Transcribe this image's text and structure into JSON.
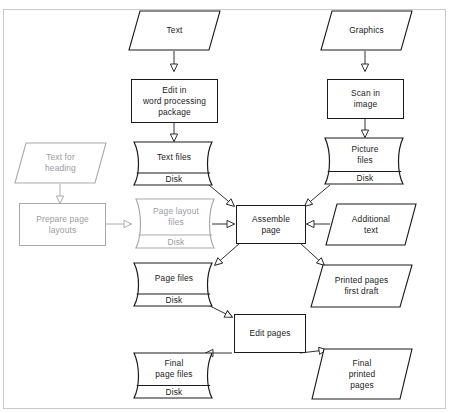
{
  "page": {
    "header_fragment": "",
    "diagram_title": "Desktop publishing workflow flowchart"
  },
  "colors": {
    "ink": "#1b1b1b",
    "dim_ink": "#9b9ba2",
    "frame": "#c9c9cf",
    "background": "#ffffff"
  },
  "nodes": {
    "text_input": {
      "label": "Text",
      "type": "input-output",
      "state": "normal"
    },
    "graphics_input": {
      "label": "Graphics",
      "type": "input-output",
      "state": "normal"
    },
    "edit_word": {
      "label": "Edit in\nword processing\npackage",
      "type": "process",
      "state": "normal"
    },
    "scan_image": {
      "label": "Scan in\nimage",
      "type": "process",
      "state": "normal"
    },
    "text_for_heading": {
      "label": "Text for\nheading",
      "type": "input-output",
      "state": "dim"
    },
    "text_files": {
      "label": "Text files",
      "type": "disk",
      "state": "normal",
      "media": "Disk"
    },
    "picture_files": {
      "label": "Picture\nfiles",
      "type": "disk",
      "state": "normal",
      "media": "Disk"
    },
    "prepare_layouts": {
      "label": "Prepare page\nlayouts",
      "type": "process",
      "state": "dim"
    },
    "page_layout_files": {
      "label": "Page layout\nfiles",
      "type": "disk",
      "state": "dim",
      "media": "Disk"
    },
    "assemble_page": {
      "label": "Assemble\npage",
      "type": "process",
      "state": "normal"
    },
    "additional_text": {
      "label": "Additional\ntext",
      "type": "input-output",
      "state": "normal"
    },
    "page_files": {
      "label": "Page files",
      "type": "disk",
      "state": "normal",
      "media": "Disk"
    },
    "printed_first": {
      "label": "Printed pages\nfirst draft",
      "type": "input-output",
      "state": "normal"
    },
    "edit_pages": {
      "label": "Edit pages",
      "type": "process",
      "state": "normal"
    },
    "final_page_files": {
      "label": "Final\npage files",
      "type": "disk",
      "state": "normal",
      "media": "Disk"
    },
    "final_printed": {
      "label": "Final\nprinted\npages",
      "type": "input-output",
      "state": "normal"
    }
  },
  "edges": [
    {
      "from": "text_input",
      "to": "edit_word",
      "style": "normal"
    },
    {
      "from": "graphics_input",
      "to": "scan_image",
      "style": "normal"
    },
    {
      "from": "edit_word",
      "to": "text_files",
      "style": "normal"
    },
    {
      "from": "scan_image",
      "to": "picture_files",
      "style": "normal"
    },
    {
      "from": "text_for_heading",
      "to": "prepare_layouts",
      "style": "dim"
    },
    {
      "from": "prepare_layouts",
      "to": "page_layout_files",
      "style": "dim"
    },
    {
      "from": "text_files",
      "to": "assemble_page",
      "style": "normal"
    },
    {
      "from": "picture_files",
      "to": "assemble_page",
      "style": "normal"
    },
    {
      "from": "page_layout_files",
      "to": "assemble_page",
      "style": "normal"
    },
    {
      "from": "additional_text",
      "to": "assemble_page",
      "style": "normal"
    },
    {
      "from": "assemble_page",
      "to": "page_files",
      "style": "normal"
    },
    {
      "from": "assemble_page",
      "to": "printed_first",
      "style": "normal"
    },
    {
      "from": "page_files",
      "to": "edit_pages",
      "style": "normal"
    },
    {
      "from": "edit_pages",
      "to": "final_page_files",
      "style": "normal"
    },
    {
      "from": "edit_pages",
      "to": "final_printed",
      "style": "normal"
    }
  ]
}
